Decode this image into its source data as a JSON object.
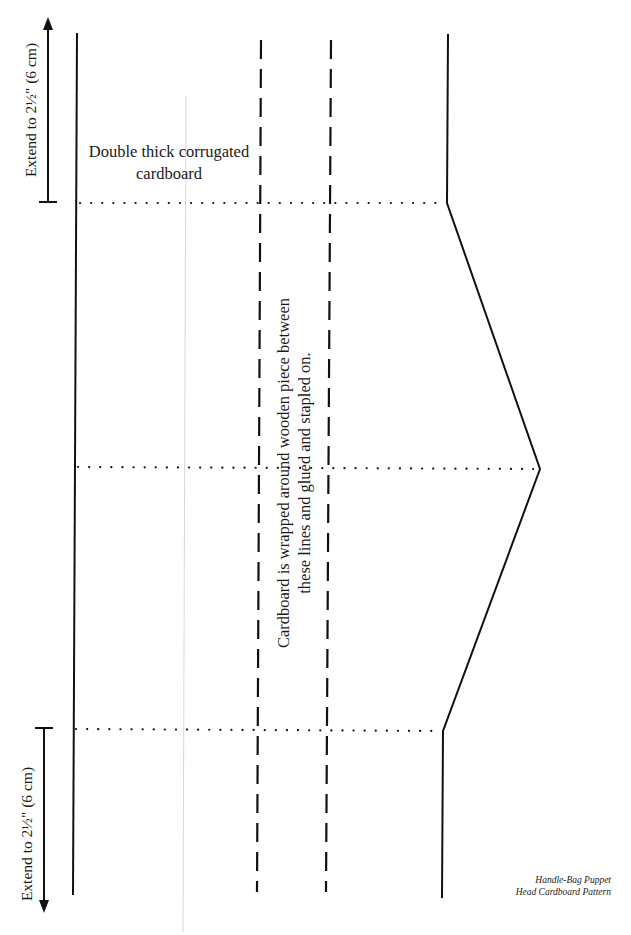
{
  "title": "Handle-Bag Puppet Head Cardboard Pattern",
  "caption": {
    "line1": "Handle-Bag Puppet",
    "line2": "Head Cardboard Pattern"
  },
  "annotations": {
    "extend_top": "Extend to 2½\" (6 cm)",
    "extend_bottom": "Extend to 2½\" (6 cm)",
    "material_line1": "Double thick corrugated",
    "material_line2": "cardboard",
    "wrap_line1": "Cardboard is wrapped around wooden piece between",
    "wrap_line2": "these lines and glued and stapled on."
  },
  "colors": {
    "ink": "#111111",
    "guide": "#d8d8d8",
    "background": "#ffffff"
  },
  "legend": {
    "solid": "cut line",
    "dashed": "wrap boundary",
    "dotted": "fold line"
  }
}
